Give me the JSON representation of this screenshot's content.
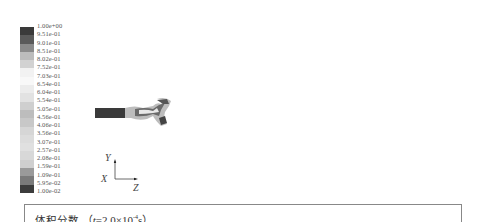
{
  "colorbar": {
    "labels": [
      "1.00e+00",
      "9.51e-01",
      "9.01e-01",
      "8.51e-01",
      "8.02e-01",
      "7.52e-01",
      "7.03e-01",
      "6.54e-01",
      "6.04e-01",
      "5.54e-01",
      "5.05e-01",
      "4.56e-01",
      "4.06e-01",
      "3.56e-01",
      "3.07e-01",
      "2.57e-01",
      "2.08e-01",
      "1.59e-01",
      "1.09e-01",
      "5.95e-02",
      "1.00e-02"
    ],
    "band_colors": [
      "#3a3a3a",
      "#5a5a5a",
      "#8a8a8a",
      "#bcbcbc",
      "#d2d2d2",
      "#f2f2f2",
      "#f8f8f8",
      "#ececec",
      "#e2e2e2",
      "#cfcfcf",
      "#bdbdbd",
      "#c8c8c8",
      "#d6d6d6",
      "#dcdcdc",
      "#e0e0e0",
      "#d8d8d8",
      "#cfcfcf",
      "#9a9a9a",
      "#7a7a7a",
      "#3c3c3c"
    ]
  },
  "axes": {
    "y_label": "Y",
    "x_label": "X",
    "z_label": "Z"
  },
  "caption": {
    "title": "体积分数",
    "open": "（",
    "var": "t",
    "eq": "=2.0×10",
    "exp": "-4",
    "unit": "s）"
  }
}
